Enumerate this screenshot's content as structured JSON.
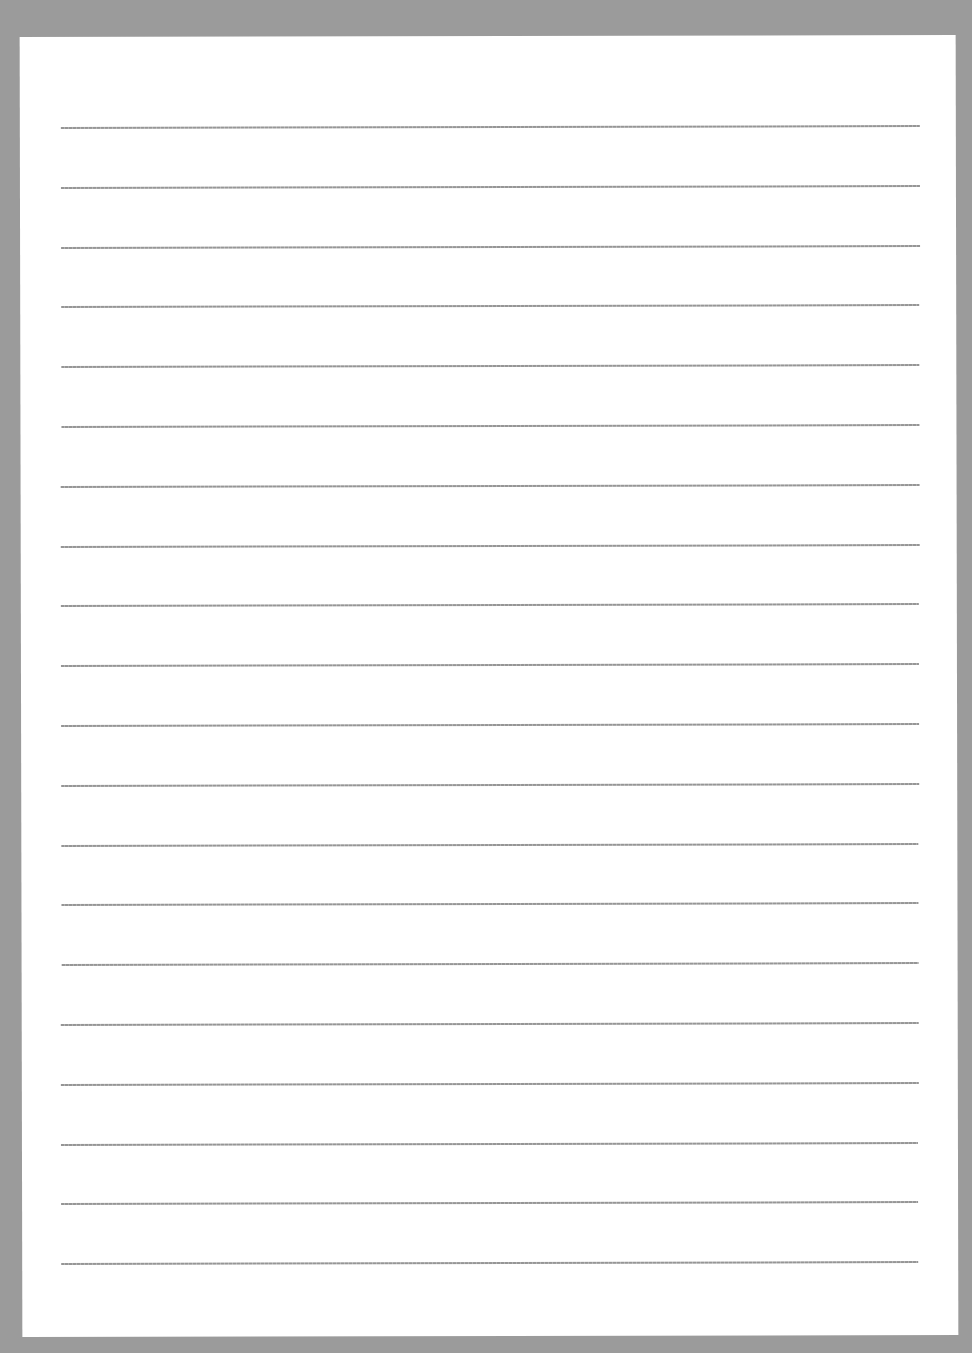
{
  "page": {
    "type": "lined-paper",
    "background_color": "#9b9b9b",
    "sheet_color": "#ffffff",
    "rule_color": "#8a8a8a",
    "rule_count": 20,
    "rule_spacing_px": 59.8
  },
  "rules": [
    {
      "index": 1
    },
    {
      "index": 2
    },
    {
      "index": 3
    },
    {
      "index": 4
    },
    {
      "index": 5
    },
    {
      "index": 6
    },
    {
      "index": 7
    },
    {
      "index": 8
    },
    {
      "index": 9
    },
    {
      "index": 10
    },
    {
      "index": 11
    },
    {
      "index": 12
    },
    {
      "index": 13
    },
    {
      "index": 14
    },
    {
      "index": 15
    },
    {
      "index": 16
    },
    {
      "index": 17
    },
    {
      "index": 18
    },
    {
      "index": 19
    },
    {
      "index": 20
    }
  ]
}
